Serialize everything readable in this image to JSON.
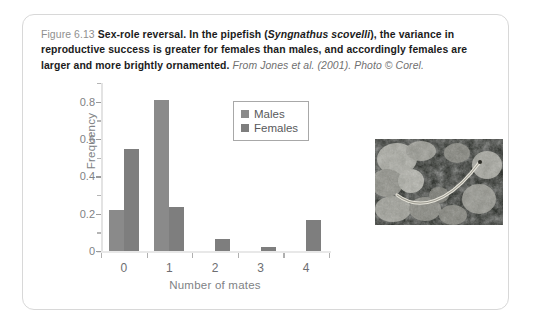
{
  "figure": {
    "number": "Figure 6.13",
    "title_bold": "Sex-role reversal.",
    "body_1": " In the pipefish (",
    "species": "Syngnathus scovelli",
    "body_2": "), the variance in reproductive success is greater for females than males, and accordingly females are larger and more brightly ornamented.",
    "source": " From Jones et al. (2001). Photo © Corel."
  },
  "chart_data": {
    "type": "bar",
    "title": "",
    "xlabel": "Number of mates",
    "ylabel": "Frequency",
    "categories": [
      "0",
      "1",
      "2",
      "3",
      "4"
    ],
    "series": [
      {
        "name": "Males",
        "values": [
          0.22,
          0.81,
          0.0,
          0.0,
          0.0
        ],
        "color": "#8a8a8a"
      },
      {
        "name": "Females",
        "values": [
          0.545,
          0.235,
          0.065,
          0.022,
          0.165
        ],
        "color": "#7e7e7e"
      }
    ],
    "ylim": [
      0,
      0.9
    ],
    "ytick_values": [
      0,
      0.2,
      0.4,
      0.6,
      0.8
    ],
    "ytick_labels": [
      "0",
      "0.2",
      "0.4",
      "0.6",
      "0.8"
    ],
    "yminor_values": [
      0.1,
      0.3,
      0.5,
      0.7,
      0.9
    ],
    "grid": false,
    "legend_position": "top-right"
  },
  "photo": {
    "name": "pipefish-photo",
    "alt": "Pipefish among seagrass"
  }
}
